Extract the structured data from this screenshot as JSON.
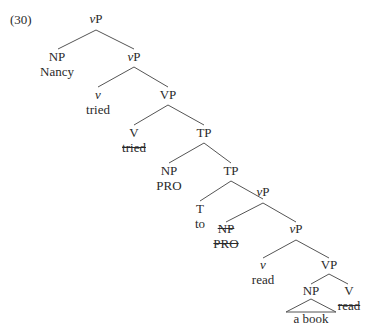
{
  "example_number": "(30)",
  "tree": {
    "nodes": [
      {
        "id": "vP1",
        "cat": "vP",
        "x": 96,
        "y": 12
      },
      {
        "id": "NP1",
        "cat": "NP",
        "x": 57,
        "y": 50,
        "word": "Nancy"
      },
      {
        "id": "vP2",
        "cat": "vP",
        "x": 134,
        "y": 50
      },
      {
        "id": "v1",
        "cat": "v",
        "x": 97,
        "y": 88,
        "word": "tried"
      },
      {
        "id": "VP1",
        "cat": "VP",
        "x": 168,
        "y": 88
      },
      {
        "id": "V1",
        "cat": "V",
        "x": 133,
        "y": 126,
        "word": "tried",
        "struck": true
      },
      {
        "id": "TP1",
        "cat": "TP",
        "x": 204,
        "y": 126
      },
      {
        "id": "NP2",
        "cat": "NP",
        "x": 168,
        "y": 164,
        "word": "PRO"
      },
      {
        "id": "TP2",
        "cat": "TP",
        "x": 231,
        "y": 164
      },
      {
        "id": "T1",
        "cat": "T",
        "x": 199,
        "y": 202,
        "word": "to"
      },
      {
        "id": "vP3",
        "cat": "vP",
        "x": 263,
        "y": 188
      },
      {
        "id": "NP3",
        "cat": "NP",
        "x": 223,
        "y": 224,
        "word": "PRO",
        "struck": true
      },
      {
        "id": "vP4",
        "cat": "vP",
        "x": 296,
        "y": 224
      },
      {
        "id": "v2",
        "cat": "v",
        "x": 261,
        "y": 260,
        "word": "read"
      },
      {
        "id": "VP2",
        "cat": "VP",
        "x": 329,
        "y": 260
      },
      {
        "id": "NP4",
        "cat": "NP",
        "x": 310,
        "y": 285,
        "word": "a book",
        "triangle": true
      },
      {
        "id": "V2",
        "cat": "V",
        "x": 349,
        "y": 285,
        "word": "read",
        "struck": true
      }
    ]
  },
  "labels": {
    "vP1": "vP",
    "NP1": "NP",
    "NP1_word": "Nancy",
    "vP2": "vP",
    "v1": "v",
    "v1_word": "tried",
    "VP1": "VP",
    "V1": "V",
    "V1_word": "tried",
    "TP1": "TP",
    "NP2": "NP",
    "NP2_word": "PRO",
    "TP2": "TP",
    "T1": "T",
    "T1_word": "to",
    "vP3": "vP",
    "NP3": "NP",
    "NP3_word": "PRO",
    "vP4": "vP",
    "v2": "v",
    "v2_word": "read",
    "VP2": "VP",
    "NP4": "NP",
    "NP4_word": "a book",
    "V2": "V",
    "V2_word": "read"
  }
}
